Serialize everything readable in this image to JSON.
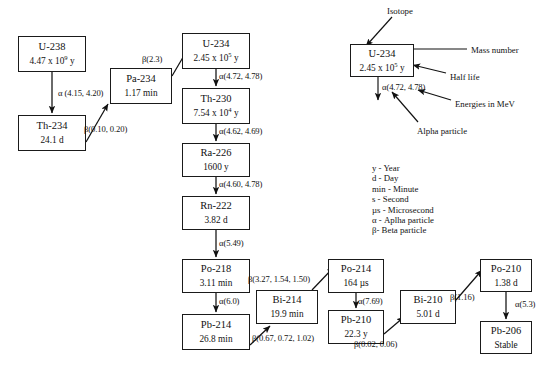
{
  "diagram": {
    "chain_nodes": [
      {
        "id": "u238",
        "name": "U-238",
        "half_life": "4.47 x 10",
        "exp": "9",
        "unit": " y",
        "x": 18,
        "y": 36,
        "w": 68,
        "h": 36
      },
      {
        "id": "th234",
        "name": "Th-234",
        "half_life": "24.1 d",
        "exp": "",
        "unit": "",
        "x": 18,
        "y": 115,
        "w": 68,
        "h": 36
      },
      {
        "id": "pa234",
        "name": "Pa-234",
        "half_life": "1.17 min",
        "exp": "",
        "unit": "",
        "x": 110,
        "y": 68,
        "w": 62,
        "h": 36
      },
      {
        "id": "u234",
        "name": "U-234",
        "half_life": "2.45 x 10",
        "exp": "5",
        "unit": " y",
        "x": 182,
        "y": 33,
        "w": 68,
        "h": 36
      },
      {
        "id": "th230",
        "name": "Th-230",
        "half_life": "7.54 x 10",
        "exp": "4",
        "unit": " y",
        "x": 182,
        "y": 88,
        "w": 68,
        "h": 36
      },
      {
        "id": "ra226",
        "name": "Ra-226",
        "half_life": "1600 y",
        "exp": "",
        "unit": "",
        "x": 182,
        "y": 143,
        "w": 68,
        "h": 34
      },
      {
        "id": "rn222",
        "name": "Rn-222",
        "half_life": "3.82 d",
        "exp": "",
        "unit": "",
        "x": 182,
        "y": 196,
        "w": 68,
        "h": 34
      },
      {
        "id": "po218",
        "name": "Po-218",
        "half_life": "3.11 min",
        "exp": "",
        "unit": "",
        "x": 182,
        "y": 259,
        "w": 68,
        "h": 34
      },
      {
        "id": "pb214",
        "name": "Pb-214",
        "half_life": "26.8 min",
        "exp": "",
        "unit": "",
        "x": 182,
        "y": 314,
        "w": 68,
        "h": 36
      },
      {
        "id": "bi214",
        "name": "Bi-214",
        "half_life": "19.9 min",
        "exp": "",
        "unit": "",
        "x": 256,
        "y": 290,
        "w": 62,
        "h": 34
      },
      {
        "id": "po214",
        "name": "Po-214",
        "half_life": "164 µs",
        "exp": "",
        "unit": "",
        "x": 328,
        "y": 259,
        "w": 56,
        "h": 34
      },
      {
        "id": "pb210",
        "name": "Pb-210",
        "half_life": "22.3 y",
        "exp": "",
        "unit": "",
        "x": 328,
        "y": 310,
        "w": 56,
        "h": 34
      },
      {
        "id": "bi210",
        "name": "Bi-210",
        "half_life": "5.01 d",
        "exp": "",
        "unit": "",
        "x": 400,
        "y": 290,
        "w": 56,
        "h": 34
      },
      {
        "id": "po210",
        "name": "Po-210",
        "half_life": "1.38 d",
        "exp": "",
        "unit": "",
        "x": 480,
        "y": 259,
        "w": 52,
        "h": 33
      },
      {
        "id": "pb206",
        "name": "Pb-206",
        "half_life": "Stable",
        "exp": "",
        "unit": "",
        "x": 480,
        "y": 321,
        "w": 52,
        "h": 33
      }
    ],
    "edge_labels": [
      {
        "id": "u238-th234",
        "text": "α (4.15, 4.20)",
        "x": 58,
        "y": 88
      },
      {
        "id": "th234-pa234",
        "text": "β(0.10, 0.20)",
        "x": 84,
        "y": 124
      },
      {
        "id": "pa234-u234",
        "text": "β(2.3)",
        "x": 142,
        "y": 54
      },
      {
        "id": "u234-th230",
        "text": "α(4.72, 4.78)",
        "x": 219,
        "y": 71
      },
      {
        "id": "th230-ra226",
        "text": "α(4.62, 4.69)",
        "x": 219,
        "y": 126
      },
      {
        "id": "ra226-rn222",
        "text": "α(4.60, 4.78)",
        "x": 219,
        "y": 179
      },
      {
        "id": "rn222-po218",
        "text": "α(5.49)",
        "x": 219,
        "y": 238
      },
      {
        "id": "po218-pb214",
        "text": "α(6.0)",
        "x": 219,
        "y": 296
      },
      {
        "id": "pb214-bi214",
        "text": "β(0.67, 0.72, 1.02)",
        "x": 252,
        "y": 333
      },
      {
        "id": "bi214-po214",
        "text": "β(3.27, 1.54, 1.50)",
        "x": 248,
        "y": 274
      },
      {
        "id": "po214-pb210",
        "text": "α(7.69)",
        "x": 358,
        "y": 296
      },
      {
        "id": "pb210-bi210",
        "text": "β(0.02, 0.06)",
        "x": 354,
        "y": 339
      },
      {
        "id": "bi210-po210",
        "text": "β(1.16)",
        "x": 450,
        "y": 292
      },
      {
        "id": "po210-pb206",
        "text": "α(5.3)",
        "x": 515,
        "y": 299
      }
    ],
    "annotation_panel": {
      "node": {
        "name": "U-234",
        "half_life": "2.45 x 10",
        "exp": "5",
        "unit": " y",
        "x": 350,
        "y": 44,
        "w": 64,
        "h": 33
      },
      "decay_label": {
        "text": "α(4.72, 4.78)",
        "x": 382,
        "y": 82
      },
      "callouts": [
        {
          "id": "isotope",
          "text": "Isotope",
          "x": 387,
          "y": 6
        },
        {
          "id": "mass-number",
          "text": "Mass number",
          "x": 471,
          "y": 45
        },
        {
          "id": "half-life",
          "text": "Half life",
          "x": 450,
          "y": 72
        },
        {
          "id": "energies",
          "text": "Energies in MeV",
          "x": 455,
          "y": 99
        },
        {
          "id": "alpha-particle",
          "text": "Alpha particle",
          "x": 417,
          "y": 126
        }
      ]
    },
    "key": [
      "y - Year",
      "d - Day",
      "min - Minute",
      "s - Second",
      "µs - Microsecond",
      "α - Aplha particle",
      "β- Beta particle"
    ]
  }
}
